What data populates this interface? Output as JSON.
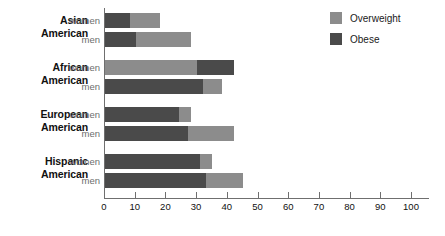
{
  "chart_data": {
    "type": "bar",
    "orientation": "horizontal",
    "stacked": true,
    "title": "",
    "xlabel": "",
    "ylabel": "",
    "xlim": [
      0,
      100
    ],
    "xticks": [
      0,
      10,
      20,
      30,
      40,
      50,
      60,
      70,
      80,
      90,
      100
    ],
    "xtick_labels": [
      "0",
      "10",
      "20",
      "30",
      "40",
      "50",
      "60",
      "70",
      "80",
      "90",
      "100"
    ],
    "grid": false,
    "legend": {
      "position": "top-right",
      "entries": [
        {
          "name": "Overweight",
          "color": "#8c8c8c"
        },
        {
          "name": "Obese",
          "color": "#4a4a4a"
        }
      ]
    },
    "groups": [
      {
        "name": "Asian American",
        "name_line1": "Asian",
        "name_line2": "American",
        "bars": [
          {
            "category": "women",
            "segment_order": [
              "Obese",
              "Overweight"
            ],
            "segments": [
              {
                "name": "Obese",
                "value": 8
              },
              {
                "name": "Overweight",
                "value": 10
              }
            ],
            "total": 18
          },
          {
            "category": "men",
            "segment_order": [
              "Obese",
              "Overweight"
            ],
            "segments": [
              {
                "name": "Obese",
                "value": 10
              },
              {
                "name": "Overweight",
                "value": 18
              }
            ],
            "total": 28
          }
        ]
      },
      {
        "name": "African American",
        "name_line1": "African",
        "name_line2": "American",
        "bars": [
          {
            "category": "women",
            "segment_order": [
              "Overweight",
              "Obese"
            ],
            "segments": [
              {
                "name": "Overweight",
                "value": 30
              },
              {
                "name": "Obese",
                "value": 12
              }
            ],
            "total": 42
          },
          {
            "category": "men",
            "segment_order": [
              "Obese",
              "Overweight"
            ],
            "segments": [
              {
                "name": "Obese",
                "value": 32
              },
              {
                "name": "Overweight",
                "value": 6
              }
            ],
            "total": 38
          }
        ]
      },
      {
        "name": "European American",
        "name_line1": "European",
        "name_line2": "American",
        "bars": [
          {
            "category": "women",
            "segment_order": [
              "Obese",
              "Overweight"
            ],
            "segments": [
              {
                "name": "Obese",
                "value": 24
              },
              {
                "name": "Overweight",
                "value": 4
              }
            ],
            "total": 28
          },
          {
            "category": "men",
            "segment_order": [
              "Obese",
              "Overweight"
            ],
            "segments": [
              {
                "name": "Obese",
                "value": 27
              },
              {
                "name": "Overweight",
                "value": 15
              }
            ],
            "total": 42
          }
        ]
      },
      {
        "name": "Hispanic American",
        "name_line1": "Hispanic",
        "name_line2": "American",
        "bars": [
          {
            "category": "women",
            "segment_order": [
              "Obese",
              "Overweight"
            ],
            "segments": [
              {
                "name": "Obese",
                "value": 31
              },
              {
                "name": "Overweight",
                "value": 4
              }
            ],
            "total": 35
          },
          {
            "category": "men",
            "segment_order": [
              "Obese",
              "Overweight"
            ],
            "segments": [
              {
                "name": "Obese",
                "value": 33
              },
              {
                "name": "Overweight",
                "value": 12
              }
            ],
            "total": 45
          }
        ]
      }
    ]
  }
}
